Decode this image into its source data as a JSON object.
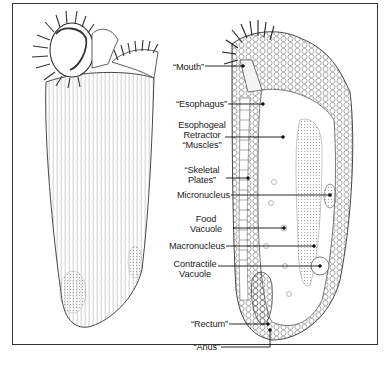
{
  "figure": {
    "colors": {
      "ink": "#222222",
      "frame": "#333333",
      "background": "#ffffff"
    }
  },
  "labels": [
    {
      "id": "mouth",
      "text": "“Mouth”"
    },
    {
      "id": "esophagus",
      "text": "“Esophagus”"
    },
    {
      "id": "esophogeal-retractor-muscles",
      "text": "Esophogeal\nRetractor\n“Muscles”"
    },
    {
      "id": "skeletal-plates",
      "text": "“Skeletal\nPlates”"
    },
    {
      "id": "micronucleus",
      "text": "Micronucleus"
    },
    {
      "id": "food-vacuole",
      "text": "Food\nVacuole"
    },
    {
      "id": "macronucleus",
      "text": "Macronucleus"
    },
    {
      "id": "contractile-vacuole",
      "text": "Contractile\nVacuole"
    },
    {
      "id": "rectum",
      "text": "“Rectum”"
    },
    {
      "id": "anus",
      "text": "“Anus”"
    }
  ]
}
